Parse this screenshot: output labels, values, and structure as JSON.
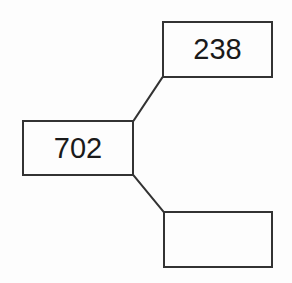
{
  "diagram": {
    "type": "node-branch-diagram",
    "background_color": "#fdfdfd",
    "stroke_color": "#333333",
    "text_color": "#1a1a1a",
    "nodes": [
      {
        "id": "root",
        "label": "702",
        "x": 22,
        "y": 120,
        "width": 112,
        "height": 56,
        "empty": false
      },
      {
        "id": "branch-top",
        "label": "238",
        "x": 162,
        "y": 21,
        "width": 111,
        "height": 57,
        "empty": false
      },
      {
        "id": "branch-bottom",
        "label": "",
        "x": 163,
        "y": 211,
        "width": 110,
        "height": 57,
        "empty": true
      }
    ],
    "connectors": [
      {
        "id": "root-to-branch-top",
        "from": "root",
        "to": "branch-top",
        "x1": 134,
        "y1": 120,
        "x2": 162,
        "y2": 78
      },
      {
        "id": "root-to-branch-bottom",
        "from": "root",
        "to": "branch-bottom",
        "x1": 134,
        "y1": 176,
        "x2": 163,
        "y2": 211
      }
    ]
  }
}
